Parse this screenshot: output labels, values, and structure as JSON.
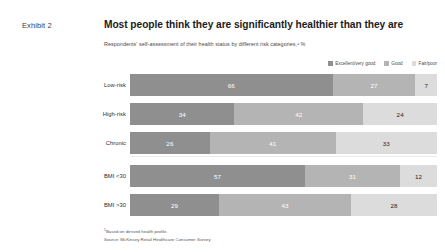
{
  "exhibit": {
    "label": "Exhibit 2"
  },
  "header": {
    "title": "Most people think they are significantly healthier than they are",
    "subtitle": "Respondents' self-assessment of their health status by different risk categories,¹ %"
  },
  "legend": {
    "items": [
      {
        "label": "Excellent/very good",
        "color": "#8f8f8f"
      },
      {
        "label": "Good",
        "color": "#b4b4b4"
      },
      {
        "label": "Fair/poor",
        "color": "#dcdcdc"
      }
    ]
  },
  "footnotes": {
    "note_marker": "1",
    "note": "Based on derived health profile.",
    "source": "Source: McKinsey Retail Healthcare Consumer Survey"
  },
  "chart_data": {
    "type": "bar",
    "orientation": "horizontal",
    "stacked": true,
    "normalized_to": 100,
    "title": "Most people think they are significantly healthier than they are",
    "subtitle": "Respondents' self-assessment of their health status by different risk categories,¹ %",
    "xlabel": "",
    "ylabel": "",
    "xlim": [
      0,
      100
    ],
    "grid": false,
    "legend_position": "top-right",
    "categories": [
      "Low-risk",
      "High-risk",
      "Chronic",
      "BMI <30",
      "BMI >30"
    ],
    "group_breaks_after": [
      "Chronic"
    ],
    "series": [
      {
        "name": "Excellent/very good",
        "color": "#8f8f8f",
        "values": [
          66,
          34,
          26,
          57,
          29
        ]
      },
      {
        "name": "Good",
        "color": "#b4b4b4",
        "values": [
          27,
          42,
          41,
          31,
          43
        ]
      },
      {
        "name": "Fair/poor",
        "color": "#dcdcdc",
        "values": [
          7,
          24,
          33,
          12,
          28
        ]
      }
    ],
    "rows": [
      {
        "label": "Low-risk",
        "values": [
          66,
          27,
          7
        ]
      },
      {
        "label": "High-risk",
        "values": [
          34,
          42,
          24
        ]
      },
      {
        "label": "Chronic",
        "values": [
          26,
          41,
          33
        ]
      },
      {
        "label": "BMI <30",
        "values": [
          57,
          31,
          12
        ]
      },
      {
        "label": "BMI >30",
        "values": [
          29,
          43,
          28
        ]
      }
    ]
  }
}
